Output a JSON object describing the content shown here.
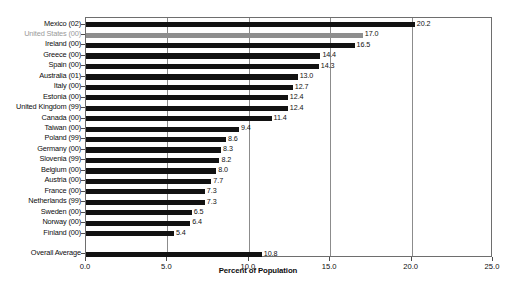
{
  "chart_data": {
    "type": "bar",
    "orientation": "horizontal",
    "title": "",
    "xlabel": "Percent of Population",
    "ylabel": "",
    "xlim": [
      0.0,
      25.0
    ],
    "xticks": [
      "0.0",
      "5.0",
      "10.0",
      "15.0",
      "20.0",
      "25.0"
    ],
    "xtick_values": [
      0.0,
      5.0,
      10.0,
      15.0,
      20.0,
      25.0
    ],
    "grid": "vertical",
    "legend": "none",
    "categories": [
      "Mexico (02)",
      "United States (00)",
      "Ireland (00)",
      "Greece (00)",
      "Spain (00)",
      "Australia (01)",
      "Italy (00)",
      "Estonia (00)",
      "United Kingdom (99)",
      "Canada (00)",
      "Taiwan (00)",
      "Poland (99)",
      "Germany (00)",
      "Slovenia (99)",
      "Belgium (00)",
      "Austria (00)",
      "France (00)",
      "Netherlands (99)",
      "Sweden (00)",
      "Norway (00)",
      "Finland (00)"
    ],
    "values": [
      20.2,
      17.0,
      16.5,
      14.4,
      14.3,
      13.0,
      12.7,
      12.4,
      12.4,
      11.4,
      9.4,
      8.6,
      8.3,
      8.2,
      8.0,
      7.7,
      7.3,
      7.3,
      6.5,
      6.4,
      5.4
    ],
    "value_labels": [
      "20.2",
      "17.0",
      "16.5",
      "14.4",
      "14.3",
      "13.0",
      "12.7",
      "12.4",
      "12.4",
      "11.4",
      "9.4",
      "8.6",
      "8.3",
      "8.2",
      "8.0",
      "7.7",
      "7.3",
      "7.3",
      "6.5",
      "6.4",
      "5.4"
    ],
    "highlight_index": 1,
    "summary": {
      "label": "Overall Average",
      "value": 10.8,
      "value_label": "10.8"
    },
    "colors": {
      "bar": "#121212",
      "highlight_bar": "#8e8e8e",
      "highlight_label": "#9a9a9a",
      "gridline": "#8c8c8c",
      "frame": "#6e6e6e",
      "background": "#ffffff",
      "text": "#0d0d0d"
    }
  }
}
